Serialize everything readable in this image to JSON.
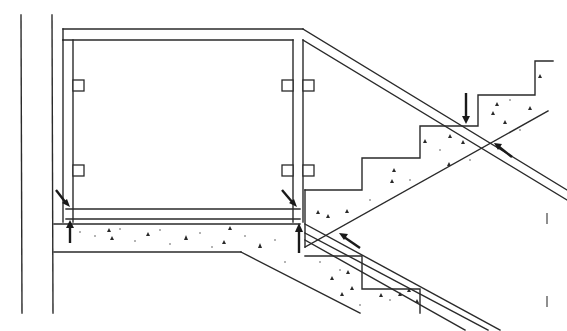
{
  "drawing": {
    "title": "Glass balustrade section at stair landing",
    "colors": {
      "line": "#2a2a2a",
      "background": "#ffffff",
      "arrow": "#1a1a1a"
    },
    "elements": {
      "wall": {
        "label": "wall",
        "x_left": 21,
        "x_right": 52
      },
      "handrail": {
        "label": "top handrail",
        "y_top": 29,
        "y_bottom": 40
      },
      "posts": [
        {
          "label": "left post",
          "x": 63
        },
        {
          "label": "middle post",
          "x": 293
        }
      ],
      "glass_clamps": [
        {
          "label": "clamp",
          "x": 74,
          "y": 80
        },
        {
          "label": "clamp",
          "x": 74,
          "y": 165
        },
        {
          "label": "clamp",
          "x": 283,
          "y": 80
        },
        {
          "label": "clamp",
          "x": 303,
          "y": 80
        },
        {
          "label": "clamp",
          "x": 283,
          "y": 165
        },
        {
          "label": "clamp",
          "x": 303,
          "y": 165
        }
      ],
      "landing_slab": {
        "label": "concrete landing slab"
      },
      "upper_flight": {
        "label": "upper stair flight"
      },
      "lower_flight": {
        "label": "lower stair flight"
      },
      "arrows": [
        {
          "label": "fixing arrow",
          "direction": "down-right"
        },
        {
          "label": "anchor arrow",
          "direction": "up"
        },
        {
          "label": "fixing arrow",
          "direction": "down-right"
        },
        {
          "label": "anchor arrow",
          "direction": "up"
        },
        {
          "label": "fixing arrow",
          "direction": "down"
        },
        {
          "label": "fixing arrow",
          "direction": "up-left"
        },
        {
          "label": "fixing arrow",
          "direction": "up-left"
        }
      ],
      "tick_marks": [
        {
          "label": "tick",
          "x": 547,
          "y": 218
        },
        {
          "label": "tick",
          "x": 547,
          "y": 301
        }
      ]
    }
  }
}
